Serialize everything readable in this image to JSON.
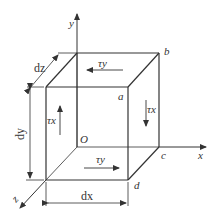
{
  "diagram": {
    "colors": {
      "background": "#ffffff",
      "line": "#333333"
    },
    "axes": {
      "x": "x",
      "y": "y",
      "z": "z"
    },
    "origin_label": "O",
    "vertices": {
      "a": "a",
      "b": "b",
      "c": "c",
      "d": "d"
    },
    "dimensions": {
      "dx": "dx",
      "dy": "dy",
      "dz": "dz"
    },
    "stresses": {
      "tau_y_top": "τy",
      "tau_y_bottom": "τy",
      "tau_x_left": "τx",
      "tau_x_right": "τx"
    }
  }
}
